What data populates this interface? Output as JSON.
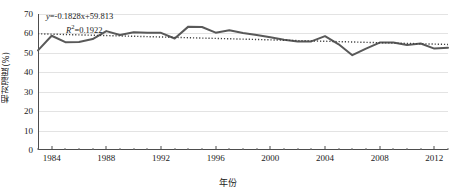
{
  "chart_data": {
    "type": "line",
    "title": "",
    "xlabel": "年份",
    "ylabel": "相对湿度(%)",
    "xlim": [
      1983,
      2013
    ],
    "ylim": [
      0,
      70
    ],
    "ytick_step": 10,
    "grid": true,
    "legend": "none",
    "x": [
      1983,
      1984,
      1985,
      1986,
      1987,
      1988,
      1989,
      1990,
      1991,
      1992,
      1993,
      1994,
      1995,
      1996,
      1997,
      1998,
      1999,
      2000,
      2001,
      2002,
      2003,
      2004,
      2005,
      2006,
      2007,
      2008,
      2009,
      2010,
      2011,
      2012,
      2013
    ],
    "series": [
      {
        "name": "相对湿度",
        "style": "solid",
        "color": "#595959",
        "values": [
          51.3,
          58.8,
          55.5,
          55.6,
          57.1,
          61.2,
          59.2,
          60.6,
          60.3,
          60.3,
          57.4,
          63.5,
          63.3,
          60.4,
          61.6,
          60.2,
          59.2,
          58.0,
          56.8,
          55.8,
          55.9,
          58.6,
          54.4,
          48.8,
          52.2,
          55.3,
          55.3,
          54.0,
          54.8,
          52.2,
          52.6
        ]
      },
      {
        "name": "线性趋势线",
        "style": "dotted",
        "color": "#404040",
        "values": [
          59.81,
          59.63,
          59.45,
          59.26,
          59.08,
          58.9,
          58.71,
          58.53,
          58.35,
          58.16,
          57.98,
          57.8,
          57.61,
          57.43,
          57.25,
          57.06,
          56.88,
          56.7,
          56.51,
          56.33,
          56.15,
          55.96,
          55.78,
          55.6,
          55.41,
          55.23,
          55.05,
          54.86,
          54.68,
          54.5,
          54.31
        ]
      }
    ],
    "ytick_labels": [
      "0",
      "10",
      "20",
      "30",
      "40",
      "50",
      "60",
      "70"
    ],
    "ytick_values": [
      0,
      10,
      20,
      30,
      40,
      50,
      60,
      70
    ],
    "xtick_labels": [
      "1984",
      "1988",
      "1992",
      "1996",
      "2000",
      "2004",
      "2008",
      "2012"
    ],
    "xtick_values": [
      1984,
      1988,
      1992,
      1996,
      2000,
      2004,
      2008,
      2012
    ],
    "annotations": {
      "equation": "y=-0.1828x+59.813",
      "equation_y": "y",
      "equation_rest": "=-0.1828x+59.813",
      "r_squared_symbol": "R",
      "r_squared_rest": "=0.1922",
      "r_squared": "R2=0.1922"
    },
    "colors": {
      "series_line": "#595959",
      "trend_line": "#404040",
      "grid": "#e3e3e3",
      "axis": "#4d4d4d",
      "background": "#ffffff",
      "text": "#1a1a1a"
    }
  }
}
